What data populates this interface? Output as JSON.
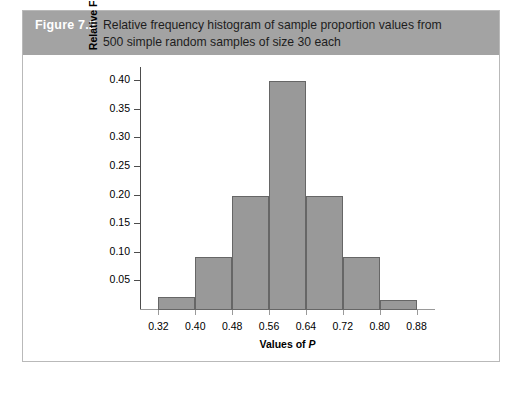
{
  "figure": {
    "number_label": "Figure 7.2",
    "caption_line1": "Relative frequency histogram of sample proportion values from",
    "caption_line2": "500 simple random samples of size 30 each",
    "banner_color": "#a3a3a3",
    "panel_border_color": "#b9b9b9"
  },
  "chart_data": {
    "type": "bar",
    "title": "Relative frequency histogram of sample proportion values from 500 simple random samples of size 30 each",
    "xlabel": "Values of P",
    "ylabel": "Relative Frequency",
    "xlim": [
      0.28,
      0.92
    ],
    "ylim": [
      0.0,
      0.425
    ],
    "grid": false,
    "legend": null,
    "bar_color": "#999999",
    "bar_edge_color": "#666666",
    "bin_width": 0.08,
    "bin_edges": [
      0.32,
      0.4,
      0.48,
      0.56,
      0.64,
      0.72,
      0.8,
      0.88
    ],
    "categories": [
      "0.32-0.40",
      "0.40-0.48",
      "0.48-0.56",
      "0.56-0.64",
      "0.64-0.72",
      "0.72-0.80",
      "0.80-0.88"
    ],
    "values": [
      0.022,
      0.092,
      0.2,
      0.4,
      0.2,
      0.092,
      0.017
    ],
    "xticks": [
      0.32,
      0.4,
      0.48,
      0.56,
      0.64,
      0.72,
      0.8,
      0.88
    ],
    "xtick_labels": [
      "0.32",
      "0.40",
      "0.48",
      "0.56",
      "0.64",
      "0.72",
      "0.80",
      "0.88"
    ],
    "yticks": [
      0.05,
      0.1,
      0.15,
      0.2,
      0.25,
      0.3,
      0.35,
      0.4
    ],
    "ytick_labels": [
      "0.05",
      "0.10",
      "0.15",
      "0.20",
      "0.25",
      "0.30",
      "0.35",
      "0.40"
    ],
    "xlabel_static": "Values of ",
    "xlabel_italic": "P"
  }
}
